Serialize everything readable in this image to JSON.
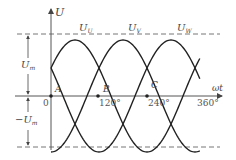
{
  "diagram": {
    "y_axis_label": "U",
    "x_axis_label": "ωt",
    "amplitude_label_pos": "U",
    "amplitude_label_pos_sub": "m",
    "amplitude_label_neg": "−U",
    "amplitude_label_neg_sub": "m",
    "origin_label": "0",
    "ticks": [
      "120°",
      "240°",
      "360°"
    ],
    "points": [
      "A",
      "B",
      "C"
    ],
    "series": [
      {
        "name": "U",
        "sub": "U",
        "phase_deg": 0
      },
      {
        "name": "U",
        "sub": "V",
        "phase_deg": 120
      },
      {
        "name": "U",
        "sub": "W",
        "phase_deg": 240
      }
    ],
    "colors": {
      "curve": "#222222",
      "axis": "#555555",
      "dash": "#777777"
    }
  }
}
